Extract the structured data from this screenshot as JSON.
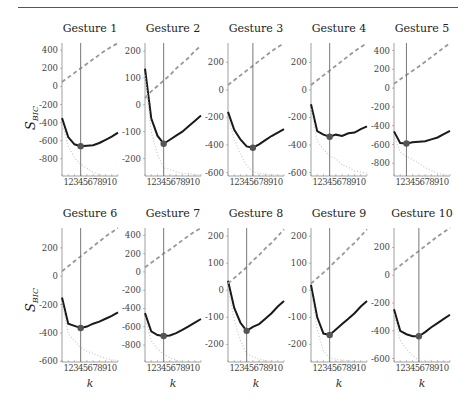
{
  "figure": {
    "ylabel_main": "S",
    "ylabel_sub": "BIC",
    "xlabel": "k",
    "colors": {
      "bic_line": "#1a1a1a",
      "penalty_dashed": "#999999",
      "likelihood_dotted": "#c8c8c8",
      "vline": "#777777",
      "marker": "#555555",
      "axis": "#888888",
      "rule": "#555555"
    }
  },
  "chart_data": [
    {
      "type": "line",
      "title": "Gesture 1",
      "xlabel": "",
      "ylabel": "S_BIC",
      "x": [
        1,
        2,
        3,
        4,
        5,
        6,
        7,
        8,
        9,
        10
      ],
      "xticklabels": [
        "1",
        "2",
        "3",
        "4",
        "5",
        "6",
        "7",
        "8",
        "9",
        "10"
      ],
      "ylim": [
        -990,
        480
      ],
      "yticks": [
        400,
        200,
        0,
        -200,
        -400,
        -600,
        -800
      ],
      "selected_k": 4,
      "series": [
        {
          "name": "S_BIC",
          "style": "solid",
          "values": [
            -350,
            -560,
            -640,
            -660,
            -655,
            -650,
            -625,
            -590,
            -555,
            -510
          ]
        },
        {
          "name": "penalty",
          "style": "dashed",
          "values": [
            50,
            100,
            150,
            200,
            250,
            300,
            350,
            400,
            440,
            480
          ]
        },
        {
          "name": "neg_log_likelihood",
          "style": "dotted",
          "values": [
            -400,
            -660,
            -790,
            -860,
            -905,
            -950,
            -975,
            -990,
            -995,
            -990
          ]
        }
      ]
    },
    {
      "type": "line",
      "title": "Gesture 2",
      "xlabel": "",
      "ylabel": "",
      "x": [
        1,
        2,
        3,
        4,
        5,
        6,
        7,
        8,
        9,
        10
      ],
      "xticklabels": [
        "1",
        "2",
        "3",
        "4",
        "5",
        "6",
        "7",
        "8",
        "9",
        "10"
      ],
      "ylim": [
        -265,
        230
      ],
      "yticks": [
        200,
        100,
        0,
        -100,
        -200
      ],
      "selected_k": 4,
      "series": [
        {
          "name": "S_BIC",
          "style": "solid",
          "values": [
            135,
            -50,
            -115,
            -145,
            -130,
            -115,
            -100,
            -80,
            -60,
            -40
          ]
        },
        {
          "name": "penalty",
          "style": "dashed",
          "values": [
            25,
            50,
            70,
            90,
            110,
            135,
            155,
            175,
            200,
            220
          ]
        },
        {
          "name": "neg_log_likelihood",
          "style": "dotted",
          "values": [
            110,
            -100,
            -185,
            -235,
            -240,
            -250,
            -255,
            -255,
            -260,
            -260
          ]
        }
      ]
    },
    {
      "type": "line",
      "title": "Gesture 3",
      "xlabel": "",
      "ylabel": "",
      "x": [
        1,
        2,
        3,
        4,
        5,
        6,
        7,
        8,
        9,
        10
      ],
      "xticklabels": [
        "1",
        "2",
        "3",
        "4",
        "5",
        "6",
        "7",
        "8",
        "9",
        "10"
      ],
      "ylim": [
        -625,
        340
      ],
      "yticks": [
        200,
        0,
        -200,
        -400,
        -600
      ],
      "selected_k": 5,
      "series": [
        {
          "name": "S_BIC",
          "style": "solid",
          "values": [
            -160,
            -290,
            -360,
            -410,
            -420,
            -395,
            -365,
            -335,
            -310,
            -285
          ]
        },
        {
          "name": "penalty",
          "style": "dashed",
          "values": [
            35,
            70,
            105,
            140,
            175,
            210,
            245,
            280,
            310,
            340
          ]
        },
        {
          "name": "neg_log_likelihood",
          "style": "dotted",
          "values": [
            -195,
            -360,
            -465,
            -550,
            -595,
            -605,
            -610,
            -615,
            -620,
            -625
          ]
        }
      ]
    },
    {
      "type": "line",
      "title": "Gesture 4",
      "xlabel": "",
      "ylabel": "",
      "x": [
        1,
        2,
        3,
        4,
        5,
        6,
        7,
        8,
        9,
        10
      ],
      "xticklabels": [
        "1",
        "2",
        "3",
        "4",
        "5",
        "6",
        "7",
        "8",
        "9",
        "10"
      ],
      "ylim": [
        -625,
        340
      ],
      "yticks": [
        200,
        0,
        -200,
        -400,
        -600
      ],
      "selected_k": 4,
      "series": [
        {
          "name": "S_BIC",
          "style": "solid",
          "values": [
            -105,
            -300,
            -325,
            -340,
            -325,
            -335,
            -315,
            -310,
            -285,
            -265
          ]
        },
        {
          "name": "penalty",
          "style": "dashed",
          "values": [
            35,
            70,
            105,
            140,
            175,
            210,
            245,
            280,
            310,
            340
          ]
        },
        {
          "name": "neg_log_likelihood",
          "style": "dotted",
          "values": [
            -140,
            -370,
            -430,
            -480,
            -500,
            -545,
            -560,
            -590,
            -595,
            -605
          ]
        }
      ]
    },
    {
      "type": "line",
      "title": "Gesture 5",
      "xlabel": "",
      "ylabel": "",
      "x": [
        1,
        2,
        3,
        4,
        5,
        6,
        7,
        8,
        9,
        10
      ],
      "xticklabels": [
        "1",
        "2",
        "3",
        "4",
        "5",
        "6",
        "7",
        "8",
        "9",
        "10"
      ],
      "ylim": [
        -935,
        480
      ],
      "yticks": [
        400,
        200,
        0,
        -200,
        -400,
        -600,
        -800
      ],
      "selected_k": 3,
      "series": [
        {
          "name": "S_BIC",
          "style": "solid",
          "values": [
            -460,
            -585,
            -590,
            -575,
            -570,
            -565,
            -545,
            -525,
            -490,
            -455
          ]
        },
        {
          "name": "penalty",
          "style": "dashed",
          "values": [
            45,
            95,
            140,
            185,
            230,
            280,
            330,
            380,
            430,
            480
          ]
        },
        {
          "name": "neg_log_likelihood",
          "style": "dotted",
          "values": [
            -505,
            -680,
            -730,
            -760,
            -800,
            -845,
            -875,
            -905,
            -920,
            -935
          ]
        }
      ]
    },
    {
      "type": "line",
      "title": "Gesture 6",
      "xlabel": "k",
      "ylabel": "S_BIC",
      "x": [
        1,
        2,
        3,
        4,
        5,
        6,
        7,
        8,
        9,
        10
      ],
      "xticklabels": [
        "1",
        "2",
        "3",
        "4",
        "5",
        "6",
        "7",
        "8",
        "9",
        "10"
      ],
      "ylim": [
        -605,
        340
      ],
      "yticks": [
        200,
        0,
        -200,
        -400,
        -600
      ],
      "selected_k": 4,
      "series": [
        {
          "name": "S_BIC",
          "style": "solid",
          "values": [
            -150,
            -335,
            -350,
            -365,
            -355,
            -335,
            -320,
            -300,
            -280,
            -255
          ]
        },
        {
          "name": "penalty",
          "style": "dashed",
          "values": [
            35,
            70,
            105,
            140,
            175,
            210,
            245,
            280,
            310,
            340
          ]
        },
        {
          "name": "neg_log_likelihood",
          "style": "dotted",
          "values": [
            -185,
            -405,
            -455,
            -505,
            -530,
            -545,
            -565,
            -580,
            -590,
            -595
          ]
        }
      ]
    },
    {
      "type": "line",
      "title": "Gesture 7",
      "xlabel": "k",
      "ylabel": "",
      "x": [
        1,
        2,
        3,
        4,
        5,
        6,
        7,
        8,
        9,
        10
      ],
      "xticklabels": [
        "1",
        "2",
        "3",
        "4",
        "5",
        "6",
        "7",
        "8",
        "9",
        "10"
      ],
      "ylim": [
        -985,
        480
      ],
      "yticks": [
        400,
        200,
        0,
        -200,
        -400,
        -600,
        -800
      ],
      "selected_k": 4,
      "series": [
        {
          "name": "S_BIC",
          "style": "solid",
          "values": [
            -450,
            -650,
            -690,
            -700,
            -695,
            -670,
            -635,
            -595,
            -555,
            -515
          ]
        },
        {
          "name": "penalty",
          "style": "dashed",
          "values": [
            50,
            100,
            150,
            200,
            245,
            295,
            345,
            395,
            440,
            480
          ]
        },
        {
          "name": "neg_log_likelihood",
          "style": "dotted",
          "values": [
            -500,
            -750,
            -840,
            -900,
            -940,
            -965,
            -980,
            -985,
            -985,
            -985
          ]
        }
      ]
    },
    {
      "type": "line",
      "title": "Gesture 8",
      "xlabel": "k",
      "ylabel": "",
      "x": [
        1,
        2,
        3,
        4,
        5,
        6,
        7,
        8,
        9,
        10
      ],
      "xticklabels": [
        "1",
        "2",
        "3",
        "4",
        "5",
        "6",
        "7",
        "8",
        "9",
        "10"
      ],
      "ylim": [
        -265,
        230
      ],
      "yticks": [
        200,
        100,
        0,
        -100,
        -200
      ],
      "selected_k": 4,
      "series": [
        {
          "name": "S_BIC",
          "style": "solid",
          "values": [
            35,
            -65,
            -120,
            -150,
            -135,
            -125,
            -105,
            -85,
            -60,
            -40
          ]
        },
        {
          "name": "penalty",
          "style": "dashed",
          "values": [
            25,
            45,
            65,
            85,
            110,
            130,
            155,
            175,
            200,
            225
          ]
        },
        {
          "name": "neg_log_likelihood",
          "style": "dotted",
          "values": [
            10,
            -110,
            -185,
            -235,
            -245,
            -255,
            -260,
            -262,
            -263,
            -265
          ]
        }
      ]
    },
    {
      "type": "line",
      "title": "Gesture 9",
      "xlabel": "k",
      "ylabel": "",
      "x": [
        1,
        2,
        3,
        4,
        5,
        6,
        7,
        8,
        9,
        10
      ],
      "xticklabels": [
        "1",
        "2",
        "3",
        "4",
        "5",
        "6",
        "7",
        "8",
        "9",
        "10"
      ],
      "ylim": [
        -265,
        230
      ],
      "yticks": [
        200,
        100,
        0,
        -100,
        -200
      ],
      "selected_k": 4,
      "series": [
        {
          "name": "S_BIC",
          "style": "solid",
          "values": [
            20,
            -100,
            -160,
            -165,
            -145,
            -125,
            -105,
            -85,
            -60,
            -40
          ]
        },
        {
          "name": "penalty",
          "style": "dashed",
          "values": [
            25,
            45,
            65,
            85,
            110,
            130,
            155,
            175,
            200,
            225
          ]
        },
        {
          "name": "neg_log_likelihood",
          "style": "dotted",
          "values": [
            -5,
            -145,
            -225,
            -250,
            -255,
            -258,
            -260,
            -262,
            -263,
            -265
          ]
        }
      ]
    },
    {
      "type": "line",
      "title": "Gesture 10",
      "xlabel": "k",
      "ylabel": "",
      "x": [
        1,
        2,
        3,
        4,
        5,
        6,
        7,
        8,
        9,
        10
      ],
      "xticklabels": [
        "1",
        "2",
        "3",
        "4",
        "5",
        "6",
        "7",
        "8",
        "9",
        "10"
      ],
      "ylim": [
        -625,
        340
      ],
      "yticks": [
        200,
        0,
        -200,
        -400,
        -600
      ],
      "selected_k": 5,
      "series": [
        {
          "name": "S_BIC",
          "style": "solid",
          "values": [
            -245,
            -400,
            -425,
            -440,
            -440,
            -410,
            -375,
            -345,
            -315,
            -285
          ]
        },
        {
          "name": "penalty",
          "style": "dashed",
          "values": [
            35,
            70,
            105,
            140,
            175,
            210,
            245,
            280,
            310,
            340
          ]
        },
        {
          "name": "neg_log_likelihood",
          "style": "dotted",
          "values": [
            -280,
            -470,
            -530,
            -580,
            -615,
            -620,
            -620,
            -625,
            -625,
            -625
          ]
        }
      ]
    }
  ]
}
